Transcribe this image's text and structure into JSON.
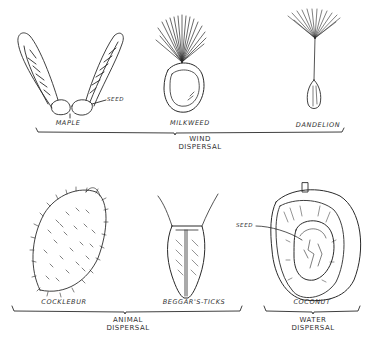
{
  "figure": {
    "groups": [
      {
        "id": "wind",
        "label_line1": "WIND",
        "label_line2": "DISPERSAL",
        "specimens": [
          {
            "name": "MAPLE",
            "callout": "SEED"
          },
          {
            "name": "MILKWEED"
          },
          {
            "name": "DANDELION"
          }
        ]
      },
      {
        "id": "animal",
        "label_line1": "ANIMAL",
        "label_line2": "DISPERSAL",
        "specimens": [
          {
            "name": "COCKLEBUR"
          },
          {
            "name": "BEGGAR'S-TICKS"
          }
        ]
      },
      {
        "id": "water",
        "label_line1": "WATER",
        "label_line2": "DISPERSAL",
        "specimens": [
          {
            "name": "COCONUT",
            "callout": "SEED"
          }
        ]
      }
    ]
  },
  "colors": {
    "ink": "#2a2a2a",
    "background": "#ffffff"
  }
}
